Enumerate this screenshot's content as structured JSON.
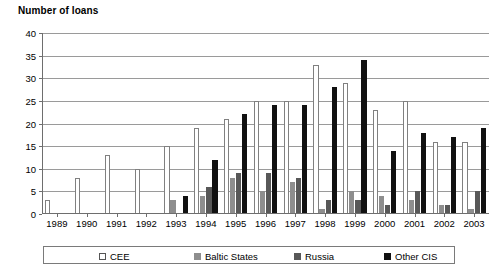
{
  "chart_data": {
    "type": "bar",
    "title": "Number of loans",
    "xlabel": "",
    "ylabel": "Number of loans",
    "ylim": [
      0,
      40
    ],
    "yticks": [
      0,
      5,
      10,
      15,
      20,
      25,
      30,
      35,
      40
    ],
    "grid": true,
    "legend_position": "bottom",
    "categories": [
      "1989",
      "1990",
      "1991",
      "1992",
      "1993",
      "1994",
      "1995",
      "1996",
      "1997",
      "1998",
      "1999",
      "2000",
      "2001",
      "2002",
      "2003"
    ],
    "series": [
      {
        "name": "CEE",
        "color": "#ffffff",
        "values": [
          3,
          8,
          13,
          10,
          15,
          19,
          21,
          25,
          25,
          33,
          29,
          23,
          25,
          16,
          16
        ]
      },
      {
        "name": "Baltic States",
        "color": "#8e8e8e",
        "values": [
          0,
          0,
          0,
          0,
          3,
          4,
          8,
          5,
          7,
          1,
          5,
          4,
          3,
          2,
          1
        ]
      },
      {
        "name": "Russia",
        "color": "#585858",
        "values": [
          0,
          0,
          0,
          0,
          0,
          6,
          9,
          9,
          8,
          3,
          3,
          2,
          5,
          2,
          5
        ]
      },
      {
        "name": "Other CIS",
        "color": "#111111",
        "values": [
          0,
          0,
          0,
          0,
          4,
          12,
          22,
          24,
          24,
          28,
          34,
          14,
          18,
          17,
          19
        ]
      }
    ]
  },
  "legend": {
    "items": [
      {
        "label": "CEE",
        "swatch": "legend-swatch-cee"
      },
      {
        "label": "Baltic States",
        "swatch": "legend-swatch-baltic"
      },
      {
        "label": "Russia",
        "swatch": "legend-swatch-russia"
      },
      {
        "label": "Other CIS",
        "swatch": "legend-swatch-cis"
      }
    ]
  }
}
